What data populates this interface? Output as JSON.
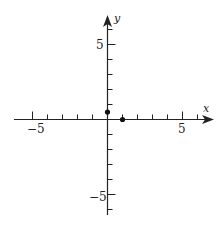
{
  "chart_data": {
    "type": "scatter",
    "title": "",
    "xlabel": "x",
    "ylabel": "y",
    "xlim": [
      -6,
      7
    ],
    "ylim": [
      -6,
      7
    ],
    "x_ticks": [
      -5,
      -4,
      -3,
      -2,
      -1,
      0,
      1,
      2,
      3,
      4,
      5,
      6
    ],
    "y_ticks": [
      -6,
      -5,
      -4,
      -3,
      -2,
      -1,
      1,
      2,
      3,
      4,
      5,
      6
    ],
    "x_tick_labels": [
      "-5",
      "5"
    ],
    "y_tick_labels": [
      "5",
      "-5"
    ],
    "grid": false,
    "points": [
      {
        "x": 0,
        "y": 0.5
      },
      {
        "x": 1,
        "y": 0
      }
    ]
  },
  "labels": {
    "x_axis": "x",
    "y_axis": "y",
    "x_neg5": "−5",
    "x_pos5": "5",
    "y_pos5": "5",
    "y_neg5": "−5"
  }
}
